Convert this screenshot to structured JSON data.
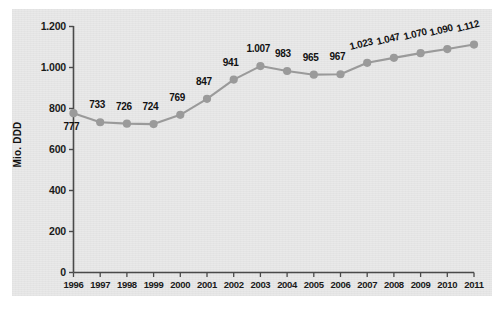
{
  "chart_data": {
    "type": "line",
    "title": "",
    "subtitle": "",
    "xlabel": "",
    "ylabel": "Mio. DDD",
    "ylim": [
      0,
      1200
    ],
    "xlim": [
      1996,
      2011
    ],
    "grid": false,
    "legend": null,
    "legend_position": "none",
    "series_color": "#9a9a9a",
    "marker_color": "#9a9a9a",
    "label_color": "#121212",
    "panel_color": "#e9e9e9",
    "categories": [
      "1996",
      "1997",
      "1998",
      "1999",
      "2000",
      "2001",
      "2002",
      "2003",
      "2004",
      "2005",
      "2006",
      "2007",
      "2008",
      "2009",
      "2010",
      "2011"
    ],
    "values": [
      777,
      733,
      726,
      724,
      769,
      847,
      941,
      1007,
      983,
      965,
      967,
      1023,
      1047,
      1070,
      1090,
      1112
    ],
    "point_labels": [
      "777",
      "733",
      "726",
      "724",
      "769",
      "847",
      "941",
      "1.007",
      "983",
      "965",
      "967",
      "1.023",
      "1.047",
      "1.070",
      "1.090",
      "1.112"
    ],
    "yticks": [
      0,
      200,
      400,
      600,
      800,
      1000,
      1200
    ],
    "ytick_labels": [
      "0",
      "200",
      "400",
      "600",
      "800",
      "1.000",
      "1.200"
    ]
  },
  "axis": {
    "y_title": "Mio. DDD"
  }
}
